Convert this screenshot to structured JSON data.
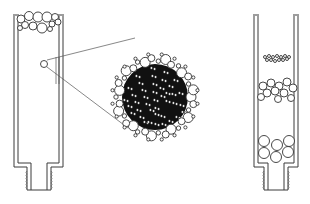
{
  "figure": {
    "colors": {
      "line": "#3a3a3a",
      "fill_dark": "#111111",
      "background": "#ffffff"
    }
  },
  "left_column": {
    "label": "",
    "top_beads": [
      [
        21,
        19,
        4
      ],
      [
        29,
        16,
        4.5
      ],
      [
        38,
        17,
        5
      ],
      [
        47,
        17,
        5
      ],
      [
        55,
        17,
        3.5
      ],
      [
        25,
        25,
        3.5
      ],
      [
        33,
        26,
        4
      ],
      [
        42,
        28,
        5
      ],
      [
        52,
        24,
        3
      ],
      [
        58,
        22,
        3
      ],
      [
        50,
        29,
        2.5
      ],
      [
        20,
        28,
        2.5
      ]
    ],
    "highlight_particle": [
      44,
      64,
      3.5
    ]
  },
  "magnified_particle": {
    "center": [
      155,
      97
    ],
    "radius": 42,
    "callout_lines": [
      [
        [
          47,
          60
        ],
        [
          135,
          38
        ]
      ],
      [
        [
          47,
          67
        ],
        [
          128,
          128
        ]
      ]
    ]
  },
  "right_column": {
    "label": "",
    "band_small": [
      [
        265,
        57,
        1.5
      ],
      [
        269,
        56,
        1.5
      ],
      [
        273,
        57,
        1.5
      ],
      [
        277,
        56,
        1.5
      ],
      [
        281,
        57,
        1.5
      ],
      [
        285,
        56,
        1.5
      ],
      [
        289,
        57,
        1.5
      ],
      [
        267,
        60,
        1.5
      ],
      [
        271,
        60,
        1.5
      ],
      [
        275,
        61,
        1.5
      ],
      [
        279,
        60,
        1.5
      ],
      [
        283,
        60,
        1.5
      ],
      [
        287,
        59,
        1.5
      ]
    ],
    "band_medium": [
      [
        263,
        86,
        4
      ],
      [
        271,
        83,
        4
      ],
      [
        279,
        86,
        4
      ],
      [
        287,
        82,
        4
      ],
      [
        293,
        88,
        4
      ],
      [
        267,
        93,
        4
      ],
      [
        275,
        91,
        4
      ],
      [
        284,
        93,
        4
      ],
      [
        261,
        97,
        3.5
      ],
      [
        278,
        99,
        3.5
      ],
      [
        291,
        98,
        3.5
      ]
    ],
    "band_large": [
      [
        264,
        141,
        5.5
      ],
      [
        277,
        145,
        5.5
      ],
      [
        289,
        141,
        5.5
      ],
      [
        264,
        153,
        5.5
      ],
      [
        276,
        157,
        5.5
      ],
      [
        288,
        152,
        5.5
      ]
    ]
  }
}
